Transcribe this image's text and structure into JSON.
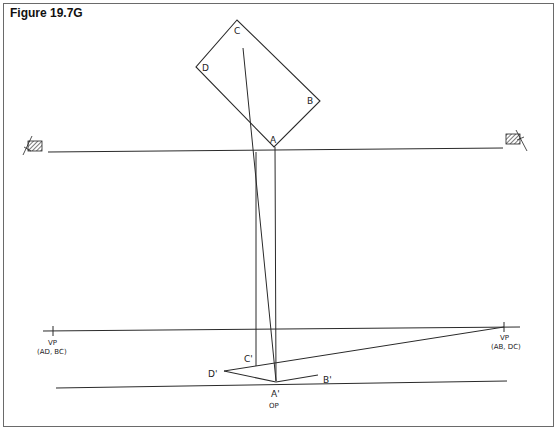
{
  "figure": {
    "title": "Figure 19.7G"
  },
  "plan": {
    "vertices": {
      "A": "A",
      "B": "B",
      "C": "C",
      "D": "D"
    }
  },
  "perspective": {
    "vertices": {
      "A": "A'",
      "B": "B'",
      "C": "C'",
      "D": "D'"
    },
    "op": "OP",
    "vp_left": {
      "label": "VP",
      "sub": "(AD, BC)"
    },
    "vp_right": {
      "label": "VP",
      "sub": "(AB, DC)"
    }
  },
  "colors": {
    "line": "#2a2a2a",
    "frame": "#6a6a6a",
    "background": "#ffffff"
  }
}
